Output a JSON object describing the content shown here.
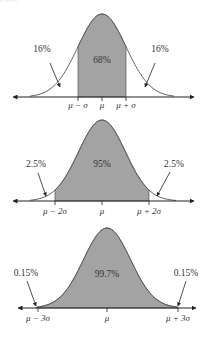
{
  "clipped_caption": "ows:",
  "colors": {
    "shade": "#a3a3a3",
    "curve": "#555555",
    "axis": "#222222",
    "text": "#333333"
  },
  "chart_data": [
    {
      "type": "area",
      "title": "Normal distribution: within 1 standard deviation",
      "center_label": "68%",
      "left_tail_label": "16%",
      "right_tail_label": "16%",
      "tick_labels": [
        "μ − σ",
        "μ",
        "μ + σ"
      ],
      "shaded_range_sigma": [
        -1,
        1
      ],
      "center_percent": 68,
      "tail_percent": 16
    },
    {
      "type": "area",
      "title": "Normal distribution: within 2 standard deviations",
      "center_label": "95%",
      "left_tail_label": "2.5%",
      "right_tail_label": "2.5%",
      "tick_labels": [
        "μ − 2σ",
        "μ",
        "μ + 2σ"
      ],
      "shaded_range_sigma": [
        -2,
        2
      ],
      "center_percent": 95,
      "tail_percent": 2.5
    },
    {
      "type": "area",
      "title": "Normal distribution: within 3 standard deviations",
      "center_label": "99.7%",
      "left_tail_label": "0.15%",
      "right_tail_label": "0.15%",
      "tick_labels": [
        "μ − 3σ",
        "μ",
        "μ + 3σ"
      ],
      "shaded_range_sigma": [
        -3,
        3
      ],
      "center_percent": 99.7,
      "tail_percent": 0.15
    }
  ],
  "layout": [
    {
      "axisY": 97,
      "mu": 102,
      "sigma": 24,
      "peakY": 14,
      "axisL": 13,
      "axisR": 194,
      "curveL": 30,
      "curveR": 174,
      "labelY": 108,
      "centerY": 63,
      "ticks": [
        78,
        102,
        126
      ],
      "leftLabel": [
        42,
        52
      ],
      "rightLabel": [
        160,
        52
      ],
      "leftArrow": [
        50,
        63,
        60,
        87
      ],
      "rightArrow": [
        155,
        63,
        145,
        87
      ]
    },
    {
      "axisY": 201,
      "mu": 102,
      "sigma": 23.5,
      "peakY": 120,
      "axisL": 13,
      "axisR": 194,
      "curveL": 30,
      "curveR": 176,
      "labelY": 214,
      "centerY": 167,
      "ticks": [
        55,
        102,
        149
      ],
      "leftLabel": [
        36,
        167
      ],
      "rightLabel": [
        174,
        167
      ],
      "leftArrow": [
        38,
        173,
        46,
        196
      ],
      "rightArrow": [
        170,
        172,
        157,
        196
      ]
    },
    {
      "axisY": 308,
      "mu": 107,
      "sigma": 23.5,
      "peakY": 228,
      "axisL": 18,
      "axisR": 196,
      "curveL": 38,
      "curveR": 178,
      "labelY": 321,
      "centerY": 277,
      "ticks": [
        38,
        107,
        178
      ],
      "leftLabel": [
        26,
        276
      ],
      "rightLabel": [
        186,
        276
      ],
      "leftArrow": [
        27,
        281,
        36,
        306
      ],
      "rightArrow": [
        186,
        281,
        178,
        306
      ]
    }
  ]
}
